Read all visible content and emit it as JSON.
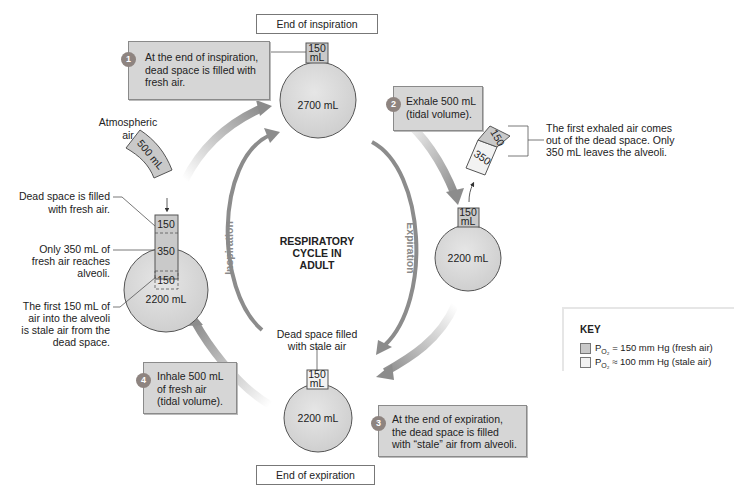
{
  "title": {
    "center_line1": "RESPIRATORY",
    "center_line2": "CYCLE IN",
    "center_line3": "ADULT"
  },
  "labels": {
    "end_of_inspiration": "End of inspiration",
    "end_of_expiration": "End of expiration",
    "inspiration_arc": "Inspiration",
    "expiration_arc": "Expiration"
  },
  "steps": [
    {
      "number": "1",
      "line1": "At the end of inspiration,",
      "line2": "dead space is filled with",
      "line3": "fresh air."
    },
    {
      "number": "2",
      "line1": "Exhale 500 mL",
      "line2": "(tidal volume)."
    },
    {
      "number": "3",
      "line1": "At the end of expiration,",
      "line2": "the dead space is filled",
      "line3": "with “stale” air from alveoli."
    },
    {
      "number": "4",
      "line1": "Inhale 500 mL",
      "line2": "of fresh air",
      "line3": "(tidal volume)."
    }
  ],
  "lungs": {
    "top": {
      "volume": "2700 mL",
      "dead_space": "150",
      "dead_space_unit": "mL"
    },
    "right": {
      "volume": "2200 mL",
      "dead_space": "150",
      "dead_space_unit": "mL"
    },
    "bottom": {
      "volume": "2200 mL",
      "dead_space": "150",
      "dead_space_unit": "mL"
    },
    "left": {
      "volume": "2200 mL",
      "seg_top": "150",
      "seg_mid": "350",
      "seg_bottom": "150"
    }
  },
  "annotations": {
    "atmospheric_1": "Atmospheric",
    "atmospheric_2": "air",
    "tidal_in": "500 mL",
    "dead_fresh_1": "Dead space is filled",
    "dead_fresh_2": "with fresh air.",
    "only350_1": "Only 350 mL of",
    "only350_2": "fresh air reaches",
    "only350_3": "alveoli.",
    "first150_1": "The first 150 mL of",
    "first150_2": "air into the alveoli",
    "first150_3": "is stale air from the",
    "first150_4": "dead space.",
    "exhaled_150": "150",
    "exhaled_350": "350",
    "first_exhaled_1": "The first exhaled air comes",
    "first_exhaled_2": "out of the dead space. Only",
    "first_exhaled_3": "350 mL leaves the alveoli.",
    "stale_filled_1": "Dead space filled",
    "stale_filled_2": "with stale air"
  },
  "key": {
    "title": "KEY",
    "fresh": {
      "p": "P",
      "sub": "O₂",
      "text": " = 150 mm Hg (fresh air)",
      "color": "#c9c9c9"
    },
    "stale": {
      "p": "P",
      "sub": "O₂",
      "text": " ≈ 100 mm Hg (stale air)",
      "color": "#f2f2f2"
    }
  },
  "colors": {
    "lung_fill": "#d8d8d8",
    "arrow": "#8c8c8c",
    "box_fill": "#d6d6d6"
  }
}
